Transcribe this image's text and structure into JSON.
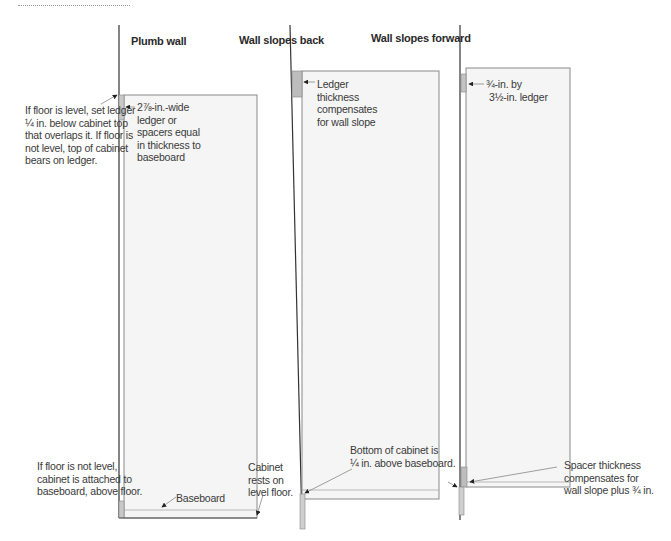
{
  "panels": [
    {
      "title": "Plumb wall",
      "callouts": {
        "ledger": "2⅞-in.-wide ledger or spacers equal in thickness to baseboard",
        "ledger_lines": [
          "2⅞-in.-wide",
          "ledger or",
          "spacers equal",
          "in thickness to",
          "baseboard"
        ],
        "left_top_lines": [
          "If floor is level, set ledger",
          "¼ in. below cabinet top",
          "that overlaps it. If floor is",
          "not level, top of cabinet",
          "bears on ledger."
        ],
        "left_bottom_lines": [
          "If floor is not level,",
          "cabinet is attached to",
          "baseboard, above floor."
        ],
        "baseboard": "Baseboard",
        "floor_lines": [
          "Cabinet",
          "rests on",
          "level floor."
        ]
      }
    },
    {
      "title": "Wall slopes back",
      "callouts": {
        "ledger_lines": [
          "Ledger",
          "thickness",
          "compensates",
          "for wall slope"
        ],
        "bottom_lines": [
          "Bottom of cabinet is",
          "¼ in. above baseboard."
        ]
      }
    },
    {
      "title": "Wall slopes forward",
      "callouts": {
        "ledger_lines": [
          "¾-in. by",
          "3½-in. ledger"
        ],
        "spacer_lines": [
          "Spacer thickness",
          "compensates for",
          "wall slope plus ¾ in."
        ]
      }
    }
  ],
  "colors": {
    "line": "#333333",
    "cabinet_fill": "#f4f4f4",
    "cabinet_stroke": "#888888",
    "ledger_fill": "#bbbbbb",
    "leader": "#666666"
  }
}
